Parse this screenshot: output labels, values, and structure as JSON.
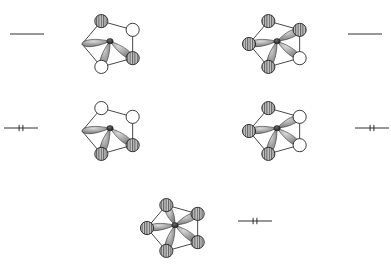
{
  "figure": {
    "title": "Cyclopentadienyl pi molecular orbital diagram",
    "ring_size": 5,
    "orbital_count": 5,
    "background_color": "#ffffff",
    "line_color": "#1a1a1a",
    "lobe_fill_color": "#8f8f8f",
    "node_hatched_fill": "#b3b3b3",
    "node_empty_fill": "#ffffff"
  },
  "chart_data": {
    "type": "diagram",
    "title": "Cyclopentadienyl pi molecular orbital diagram",
    "xlabel": "",
    "ylabel": "",
    "legend_position": "none",
    "grid": false,
    "orbitals": [
      {
        "id": "psi4",
        "label": "",
        "level_position": "upper-left",
        "energy_rank": 4,
        "electrons": 0,
        "occupancy_marks": 0,
        "level_style": "plain",
        "ring_center_x": 110,
        "ring_center_y": 44,
        "ring_radius": 28,
        "lobe_count": 3,
        "node_phases": [
          "empty",
          "hatched",
          "hatched",
          "empty",
          "none"
        ],
        "vertices": [
          {
            "angle_deg": 270,
            "phase": "none"
          },
          {
            "angle_deg": 342,
            "phase": "hatched"
          },
          {
            "angle_deg": 54,
            "phase": "empty"
          },
          {
            "angle_deg": 126,
            "phase": "hatched"
          },
          {
            "angle_deg": 198,
            "phase": "empty"
          }
        ]
      },
      {
        "id": "psi5",
        "label": "",
        "level_position": "upper-right",
        "energy_rank": 5,
        "electrons": 0,
        "occupancy_marks": 0,
        "level_style": "plain",
        "ring_center_x": 277,
        "ring_center_y": 44,
        "ring_radius": 28,
        "lobe_count": 4,
        "vertices": [
          {
            "angle_deg": 270,
            "phase": "hatched"
          },
          {
            "angle_deg": 342,
            "phase": "hatched"
          },
          {
            "angle_deg": 54,
            "phase": "hatched"
          },
          {
            "angle_deg": 126,
            "phase": "empty"
          },
          {
            "angle_deg": 198,
            "phase": "hatched"
          }
        ]
      },
      {
        "id": "psi2",
        "label": "",
        "level_position": "middle-left",
        "energy_rank": 2,
        "electrons": 2,
        "occupancy_marks": 2,
        "level_style": "ticked",
        "ring_center_x": 110,
        "ring_center_y": 131,
        "ring_radius": 28,
        "lobe_count": 3,
        "vertices": [
          {
            "angle_deg": 270,
            "phase": "none"
          },
          {
            "angle_deg": 342,
            "phase": "empty"
          },
          {
            "angle_deg": 54,
            "phase": "empty"
          },
          {
            "angle_deg": 126,
            "phase": "hatched"
          },
          {
            "angle_deg": 198,
            "phase": "hatched"
          }
        ]
      },
      {
        "id": "psi3",
        "label": "",
        "level_position": "middle-right",
        "energy_rank": 3,
        "electrons": 2,
        "occupancy_marks": 2,
        "level_style": "ticked",
        "ring_center_x": 277,
        "ring_center_y": 131,
        "ring_radius": 28,
        "lobe_count": 4,
        "vertices": [
          {
            "angle_deg": 270,
            "phase": "hatched"
          },
          {
            "angle_deg": 342,
            "phase": "hatched"
          },
          {
            "angle_deg": 54,
            "phase": "empty"
          },
          {
            "angle_deg": 126,
            "phase": "empty"
          },
          {
            "angle_deg": 198,
            "phase": "hatched"
          }
        ]
      },
      {
        "id": "psi1",
        "label": "",
        "level_position": "bottom-center",
        "energy_rank": 1,
        "electrons": 2,
        "occupancy_marks": 2,
        "level_style": "ticked",
        "ring_center_x": 175,
        "ring_center_y": 228,
        "ring_radius": 28,
        "lobe_count": 5,
        "vertices": [
          {
            "angle_deg": 270,
            "phase": "hatched"
          },
          {
            "angle_deg": 342,
            "phase": "hatched"
          },
          {
            "angle_deg": 54,
            "phase": "hatched"
          },
          {
            "angle_deg": 126,
            "phase": "hatched"
          },
          {
            "angle_deg": 198,
            "phase": "hatched"
          }
        ]
      }
    ],
    "energy_levels": [
      {
        "id": "level-upper-left",
        "x1": 10,
        "x2": 44,
        "y": 34,
        "ticks": 0
      },
      {
        "id": "level-upper-right",
        "x1": 348,
        "x2": 382,
        "y": 34,
        "ticks": 0
      },
      {
        "id": "level-middle-left",
        "x1": 4,
        "x2": 38,
        "y": 128,
        "ticks": 2
      },
      {
        "id": "level-middle-right",
        "x1": 355,
        "x2": 389,
        "y": 128,
        "ticks": 2
      },
      {
        "id": "level-bottom-center",
        "x1": 238,
        "x2": 272,
        "y": 221,
        "ticks": 2
      }
    ]
  }
}
